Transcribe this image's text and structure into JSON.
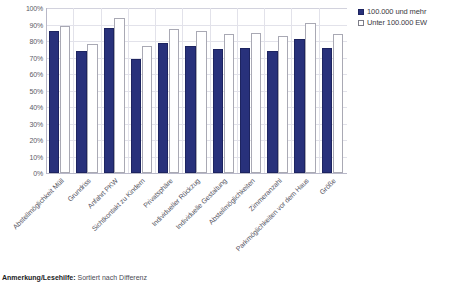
{
  "chart_data": {
    "type": "bar",
    "title": "",
    "subtitle": "",
    "xlabel": "",
    "ylabel": "",
    "ylim": [
      0,
      100
    ],
    "ytick_labels": [
      "100%",
      "90%",
      "80%",
      "70%",
      "60%",
      "50%",
      "40%",
      "30%",
      "20%",
      "10%",
      "0%"
    ],
    "ytick_values": [
      100,
      90,
      80,
      70,
      60,
      50,
      40,
      30,
      20,
      10,
      0
    ],
    "grid": true,
    "legend_position": "right",
    "categories": [
      "Abstellmöglichkeit Müll",
      "Grundriss",
      "Anfahrt PKW",
      "Sichtkontakt zu Kindern",
      "Privatsphäre",
      "Individueller Rückzug",
      "Individuelle Gestaltung",
      "Abstellmöglichkeiten",
      "Zimmeranzahl",
      "Parkmöglichkeiten vor dem Haus",
      "Größe"
    ],
    "series": [
      {
        "name": "100.000 und mehr",
        "color": "#28317b",
        "values": [
          86,
          74,
          88,
          69,
          79,
          77,
          75,
          76,
          74,
          81,
          76
        ]
      },
      {
        "name": "Unter 100.000 EW",
        "color": "#ffffff",
        "values": [
          89,
          78,
          94,
          77,
          87,
          86,
          84,
          85,
          83,
          91,
          84
        ]
      }
    ]
  },
  "legend": {
    "items": [
      {
        "label": "100.000 und mehr",
        "style": "dark"
      },
      {
        "label": "Unter 100.000 EW",
        "style": "light"
      }
    ]
  },
  "footnote": {
    "label": "Anmerkung/Lesehilfe:",
    "text": " Sortiert nach Differenz"
  }
}
